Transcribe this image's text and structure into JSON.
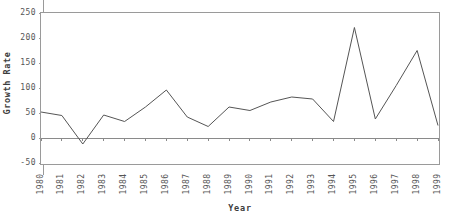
{
  "chart_data": {
    "type": "line",
    "title": "",
    "xlabel": "Year",
    "ylabel": "Growth Rate",
    "grid": false,
    "legend": "none",
    "xlim": [
      1980,
      1999
    ],
    "ylim": [
      -50,
      250
    ],
    "ytick_values": [
      250,
      200,
      150,
      100,
      50,
      0,
      -50
    ],
    "ytick_labels": [
      "250",
      "200",
      "150",
      "100",
      "50",
      "0",
      "-50"
    ],
    "categories": [
      "1980",
      "1981",
      "1982",
      "1983",
      "1984",
      "1985",
      "1986",
      "1987",
      "1988",
      "1989",
      "1990",
      "1991",
      "1992",
      "1993",
      "1994",
      "1995",
      "1996",
      "1997",
      "1998",
      "1999"
    ],
    "x": [
      1980,
      1981,
      1982,
      1983,
      1984,
      1985,
      1986,
      1987,
      1988,
      1989,
      1990,
      1991,
      1992,
      1993,
      1994,
      1995,
      1996,
      1997,
      1998,
      1999
    ],
    "values": [
      52,
      45,
      -12,
      46,
      33,
      62,
      96,
      42,
      23,
      62,
      55,
      72,
      82,
      78,
      33,
      221,
      38,
      105,
      175,
      25
    ],
    "series": [
      {
        "name": "Growth Rate",
        "color": "#555555",
        "values": [
          52,
          45,
          -12,
          46,
          33,
          62,
          96,
          42,
          23,
          62,
          55,
          72,
          82,
          78,
          33,
          221,
          38,
          105,
          175,
          25
        ]
      }
    ],
    "reference_line": {
      "value": 0,
      "color": "#8a8a8a"
    },
    "frame_color": "#9a9a9a",
    "line_color": "#555555",
    "text_color": "#555555"
  }
}
